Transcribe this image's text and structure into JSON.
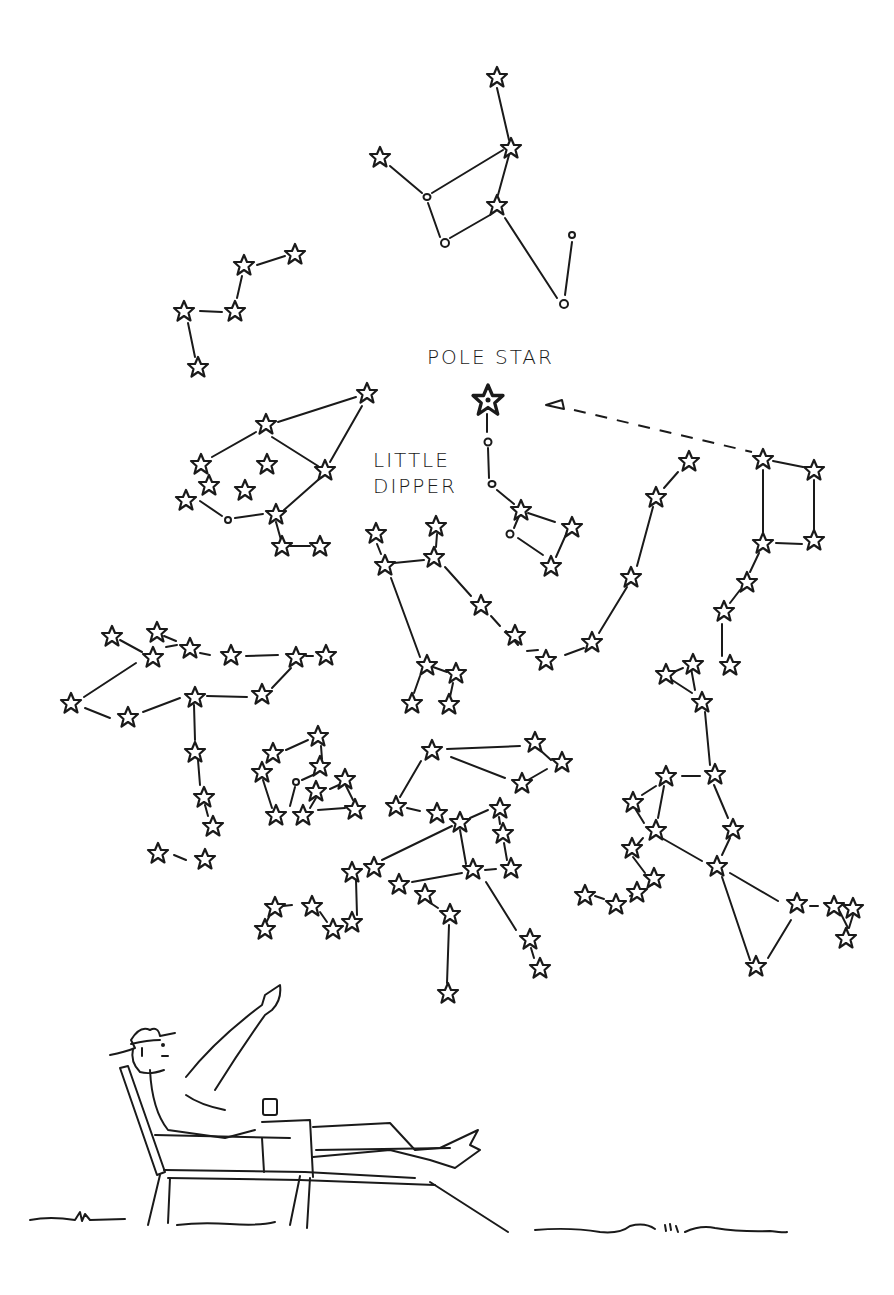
{
  "labels": {
    "pole_star": "Pole Star",
    "little_dipper_line1": "Little",
    "little_dipper_line2": "Dipper"
  },
  "colors": {
    "ink": "#1a1a1a",
    "paper": "#ffffff"
  },
  "scene": {
    "figure": "man reclining in lounge chair pointing at the sky, holding a drink, wearing a hat",
    "pointer": "dashed arrow from Big Dipper pointer stars to the Pole Star"
  }
}
